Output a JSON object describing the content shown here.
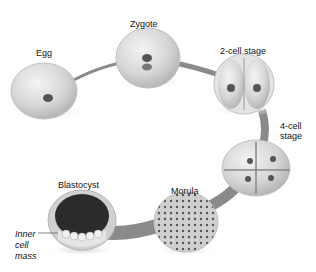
{
  "diagram": {
    "stages": [
      {
        "id": "egg",
        "label": "Egg"
      },
      {
        "id": "zygote",
        "label": "Zygote"
      },
      {
        "id": "two-cell",
        "label": "2-cell stage"
      },
      {
        "id": "four-cell",
        "label_line1": "4-cell",
        "label_line2": "stage"
      },
      {
        "id": "morula",
        "label": "Morula"
      },
      {
        "id": "blastocyst",
        "label": "Blastocyst"
      }
    ],
    "annotation": {
      "line1": "Inner",
      "line2": "cell",
      "line3": "mass"
    },
    "colors": {
      "cell": "#d9d9d9",
      "cell_edge": "#b5b5b5",
      "path": "#8a8a8a",
      "nucleus": "#555555",
      "cavity": "#2b2b2b"
    }
  }
}
